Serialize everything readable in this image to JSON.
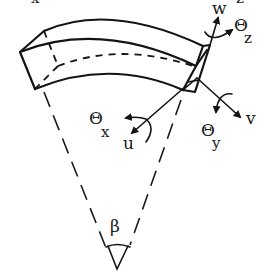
{
  "figure": {
    "top_fragments": [
      "x",
      "z"
    ],
    "labels": {
      "w": "w",
      "theta_z": "Θ",
      "theta_z_sub": "z",
      "v": "v",
      "theta_y": "Θ",
      "theta_y_sub": "y",
      "theta_x": "Θ",
      "theta_x_sub": "x",
      "u": "u",
      "beta": "β"
    },
    "colors": {
      "ink": "#141414",
      "background": "#ffffff"
    }
  }
}
